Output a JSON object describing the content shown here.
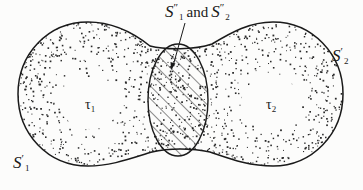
{
  "figure": {
    "labels": {
      "s1_outer": {
        "symbol": "S",
        "prime": "′",
        "subscript": "1"
      },
      "s2_outer": {
        "symbol": "S",
        "prime": "′",
        "subscript": "2"
      },
      "tau1": {
        "symbol": "τ",
        "subscript": "1"
      },
      "tau2": {
        "symbol": "τ",
        "subscript": "2"
      },
      "overlap": {
        "part1": {
          "symbol": "S",
          "prime": "″",
          "subscript": "1"
        },
        "conjunction": "and",
        "part2": {
          "symbol": "S",
          "prime": "″",
          "subscript": "2"
        }
      }
    },
    "colors": {
      "outline": "#1a1a1a",
      "stipple": "#2a2a2a",
      "hatch": "#1a1a1a",
      "background": "#fcfcfb"
    }
  }
}
